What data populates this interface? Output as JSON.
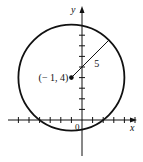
{
  "diagram": {
    "type": "circle-on-coordinate-plane",
    "x_axis_label": "x",
    "y_axis_label": "y",
    "origin_label": "0",
    "center": {
      "x": -1,
      "y": 4
    },
    "center_label": "(− 1, 4)",
    "radius": 5,
    "radius_label": "5",
    "radius_direction_deg": 45,
    "x_ticks": [
      -6,
      -5,
      -4,
      -3,
      -2,
      -1,
      1,
      2,
      3,
      4,
      5
    ],
    "y_ticks": [
      1,
      2,
      3,
      4,
      5,
      6,
      7,
      8
    ],
    "colors": {
      "stroke": "#111111",
      "background": "#ffffff"
    }
  }
}
